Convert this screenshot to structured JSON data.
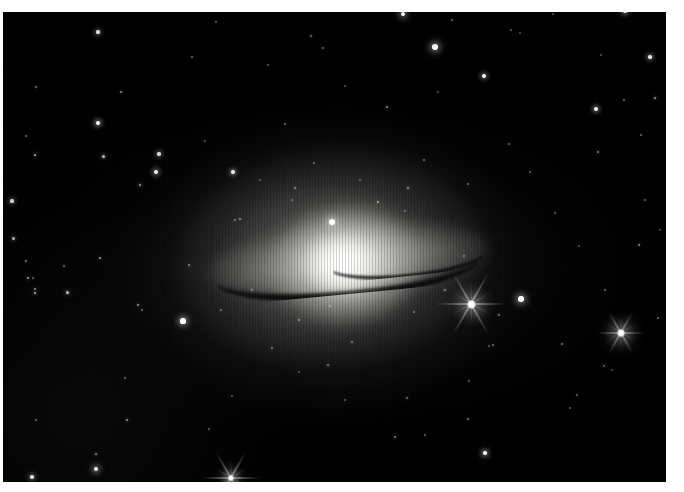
{
  "page": {
    "width": 684,
    "height": 492,
    "background_color": "#ffffff"
  },
  "plate": {
    "name": "sombrero-galaxy-photograph",
    "left": 3,
    "top": 12,
    "width": 663,
    "height": 470,
    "sky_color": "#000000",
    "border_color": "#ffffff"
  },
  "galaxy": {
    "label": "Sombrero Galaxy",
    "designation": "M104",
    "type": "edge-on spiral galaxy",
    "center_x": 335,
    "center_y": 262,
    "disk_position_angle_deg": -5.2,
    "disk_width": 280,
    "disk_height": 78,
    "bulge_width": 150,
    "bulge_height": 118,
    "core_color": "#ffffff",
    "halo_color": "#9a9892",
    "dust_lane_color": "#040405",
    "dust_lane_visible": true
  },
  "stars": [
    {
      "x": 98,
      "y": 32,
      "r": 1.6,
      "b": 0.85
    },
    {
      "x": 121,
      "y": 92,
      "r": 1.1,
      "b": 0.55
    },
    {
      "x": 98,
      "y": 123,
      "r": 2.1,
      "b": 1.0
    },
    {
      "x": 36,
      "y": 87,
      "r": 1.0,
      "b": 0.45
    },
    {
      "x": 26,
      "y": 136,
      "r": 1.0,
      "b": 0.4
    },
    {
      "x": 192,
      "y": 57,
      "r": 1.0,
      "b": 0.4
    },
    {
      "x": 216,
      "y": 22,
      "r": 0.9,
      "b": 0.35
    },
    {
      "x": 311,
      "y": 36,
      "r": 1.0,
      "b": 0.45
    },
    {
      "x": 268,
      "y": 65,
      "r": 0.9,
      "b": 0.35
    },
    {
      "x": 323,
      "y": 48,
      "r": 1.0,
      "b": 0.42
    },
    {
      "x": 403,
      "y": 14,
      "r": 2.4,
      "b": 1.0
    },
    {
      "x": 435,
      "y": 47,
      "r": 3.0,
      "b": 1.0
    },
    {
      "x": 452,
      "y": 20,
      "r": 0.9,
      "b": 0.38
    },
    {
      "x": 511,
      "y": 30,
      "r": 0.9,
      "b": 0.36
    },
    {
      "x": 520,
      "y": 33,
      "r": 0.8,
      "b": 0.3
    },
    {
      "x": 553,
      "y": 14,
      "r": 0.9,
      "b": 0.34
    },
    {
      "x": 601,
      "y": 55,
      "r": 0.9,
      "b": 0.33
    },
    {
      "x": 650,
      "y": 57,
      "r": 1.8,
      "b": 0.9
    },
    {
      "x": 484,
      "y": 76,
      "r": 1.9,
      "b": 0.95
    },
    {
      "x": 596,
      "y": 109,
      "r": 2.0,
      "b": 0.95
    },
    {
      "x": 625,
      "y": 11,
      "r": 2.2,
      "b": 1.0
    },
    {
      "x": 655,
      "y": 98,
      "r": 1.3,
      "b": 0.6
    },
    {
      "x": 624,
      "y": 100,
      "r": 1.0,
      "b": 0.42
    },
    {
      "x": 387,
      "y": 107,
      "r": 1.2,
      "b": 0.55
    },
    {
      "x": 438,
      "y": 92,
      "r": 0.9,
      "b": 0.34
    },
    {
      "x": 285,
      "y": 124,
      "r": 1.0,
      "b": 0.42
    },
    {
      "x": 345,
      "y": 86,
      "r": 0.9,
      "b": 0.32
    },
    {
      "x": 159,
      "y": 154,
      "r": 1.7,
      "b": 0.85
    },
    {
      "x": 35,
      "y": 155,
      "r": 1.4,
      "b": 0.68
    },
    {
      "x": 103,
      "y": 156,
      "r": 1.5,
      "b": 0.72
    },
    {
      "x": 156,
      "y": 172,
      "r": 2.0,
      "b": 0.95
    },
    {
      "x": 233,
      "y": 172,
      "r": 1.8,
      "b": 0.9
    },
    {
      "x": 140,
      "y": 185,
      "r": 1.4,
      "b": 0.65
    },
    {
      "x": 205,
      "y": 141,
      "r": 0.9,
      "b": 0.34
    },
    {
      "x": 12,
      "y": 201,
      "r": 1.6,
      "b": 0.8
    },
    {
      "x": 13,
      "y": 238,
      "r": 1.5,
      "b": 0.7
    },
    {
      "x": 26,
      "y": 261,
      "r": 1.1,
      "b": 0.48
    },
    {
      "x": 28,
      "y": 278,
      "r": 1.3,
      "b": 0.6
    },
    {
      "x": 33,
      "y": 278,
      "r": 1.0,
      "b": 0.4
    },
    {
      "x": 100,
      "y": 258,
      "r": 1.3,
      "b": 0.58
    },
    {
      "x": 64,
      "y": 266,
      "r": 1.1,
      "b": 0.46
    },
    {
      "x": 35,
      "y": 289,
      "r": 1.2,
      "b": 0.52
    },
    {
      "x": 67,
      "y": 292,
      "r": 1.5,
      "b": 0.75
    },
    {
      "x": 35,
      "y": 293,
      "r": 1.4,
      "b": 0.68
    },
    {
      "x": 138,
      "y": 305,
      "r": 1.3,
      "b": 0.58
    },
    {
      "x": 189,
      "y": 265,
      "r": 1.1,
      "b": 0.46
    },
    {
      "x": 142,
      "y": 310,
      "r": 1.0,
      "b": 0.4
    },
    {
      "x": 240,
      "y": 219,
      "r": 1.1,
      "b": 0.48
    },
    {
      "x": 235,
      "y": 220,
      "r": 1.0,
      "b": 0.4
    },
    {
      "x": 332,
      "y": 222,
      "r": 3.0,
      "b": 1.0
    },
    {
      "x": 295,
      "y": 188,
      "r": 1.1,
      "b": 0.5
    },
    {
      "x": 292,
      "y": 200,
      "r": 0.9,
      "b": 0.34
    },
    {
      "x": 378,
      "y": 202,
      "r": 1.2,
      "b": 0.55
    },
    {
      "x": 408,
      "y": 188,
      "r": 1.2,
      "b": 0.55
    },
    {
      "x": 405,
      "y": 211,
      "r": 0.9,
      "b": 0.36
    },
    {
      "x": 360,
      "y": 180,
      "r": 0.9,
      "b": 0.32
    },
    {
      "x": 314,
      "y": 163,
      "r": 0.9,
      "b": 0.34
    },
    {
      "x": 260,
      "y": 180,
      "r": 0.9,
      "b": 0.3
    },
    {
      "x": 424,
      "y": 160,
      "r": 1.0,
      "b": 0.4
    },
    {
      "x": 468,
      "y": 184,
      "r": 1.0,
      "b": 0.42
    },
    {
      "x": 330,
      "y": 306,
      "r": 1.0,
      "b": 0.4
    },
    {
      "x": 299,
      "y": 320,
      "r": 1.2,
      "b": 0.52
    },
    {
      "x": 272,
      "y": 348,
      "r": 1.0,
      "b": 0.42
    },
    {
      "x": 352,
      "y": 342,
      "r": 1.1,
      "b": 0.45
    },
    {
      "x": 328,
      "y": 365,
      "r": 1.1,
      "b": 0.45
    },
    {
      "x": 221,
      "y": 310,
      "r": 1.0,
      "b": 0.4
    },
    {
      "x": 252,
      "y": 290,
      "r": 1.0,
      "b": 0.38
    },
    {
      "x": 414,
      "y": 312,
      "r": 1.0,
      "b": 0.4
    },
    {
      "x": 445,
      "y": 290,
      "r": 1.2,
      "b": 0.52
    },
    {
      "x": 464,
      "y": 256,
      "r": 1.0,
      "b": 0.4
    },
    {
      "x": 521,
      "y": 299,
      "r": 2.8,
      "b": 1.0
    },
    {
      "x": 605,
      "y": 290,
      "r": 1.0,
      "b": 0.4
    },
    {
      "x": 499,
      "y": 315,
      "r": 1.1,
      "b": 0.45
    },
    {
      "x": 562,
      "y": 344,
      "r": 1.1,
      "b": 0.46
    },
    {
      "x": 493,
      "y": 345,
      "r": 1.0,
      "b": 0.4
    },
    {
      "x": 604,
      "y": 366,
      "r": 1.0,
      "b": 0.38
    },
    {
      "x": 183,
      "y": 321,
      "r": 2.6,
      "b": 1.0
    },
    {
      "x": 489,
      "y": 346,
      "r": 0.9,
      "b": 0.32
    },
    {
      "x": 469,
      "y": 381,
      "r": 1.0,
      "b": 0.4
    },
    {
      "x": 407,
      "y": 398,
      "r": 1.1,
      "b": 0.45
    },
    {
      "x": 345,
      "y": 400,
      "r": 0.9,
      "b": 0.34
    },
    {
      "x": 468,
      "y": 419,
      "r": 1.1,
      "b": 0.46
    },
    {
      "x": 425,
      "y": 435,
      "r": 1.0,
      "b": 0.4
    },
    {
      "x": 577,
      "y": 395,
      "r": 1.0,
      "b": 0.4
    },
    {
      "x": 395,
      "y": 437,
      "r": 1.2,
      "b": 0.52
    },
    {
      "x": 485,
      "y": 453,
      "r": 2.2,
      "b": 1.0
    },
    {
      "x": 570,
      "y": 408,
      "r": 0.9,
      "b": 0.34
    },
    {
      "x": 612,
      "y": 370,
      "r": 0.9,
      "b": 0.3
    },
    {
      "x": 96,
      "y": 454,
      "r": 1.2,
      "b": 0.52
    },
    {
      "x": 96,
      "y": 469,
      "r": 2.4,
      "b": 1.0
    },
    {
      "x": 32,
      "y": 477,
      "r": 1.8,
      "b": 0.85
    },
    {
      "x": 127,
      "y": 420,
      "r": 1.3,
      "b": 0.58
    },
    {
      "x": 125,
      "y": 378,
      "r": 1.0,
      "b": 0.4
    },
    {
      "x": 36,
      "y": 420,
      "r": 1.0,
      "b": 0.4
    },
    {
      "x": 209,
      "y": 429,
      "r": 0.9,
      "b": 0.34
    },
    {
      "x": 232,
      "y": 396,
      "r": 0.9,
      "b": 0.32
    },
    {
      "x": 299,
      "y": 372,
      "r": 0.9,
      "b": 0.32
    },
    {
      "x": 639,
      "y": 245,
      "r": 1.2,
      "b": 0.55
    },
    {
      "x": 660,
      "y": 230,
      "r": 0.9,
      "b": 0.32
    },
    {
      "x": 645,
      "y": 200,
      "r": 1.0,
      "b": 0.38
    },
    {
      "x": 598,
      "y": 152,
      "r": 1.2,
      "b": 0.52
    },
    {
      "x": 530,
      "y": 172,
      "r": 1.0,
      "b": 0.4
    },
    {
      "x": 555,
      "y": 213,
      "r": 1.0,
      "b": 0.38
    },
    {
      "x": 641,
      "y": 135,
      "r": 1.0,
      "b": 0.4
    },
    {
      "x": 509,
      "y": 144,
      "r": 1.0,
      "b": 0.38
    },
    {
      "x": 579,
      "y": 246,
      "r": 0.9,
      "b": 0.32
    },
    {
      "x": 658,
      "y": 318,
      "r": 1.0,
      "b": 0.4
    }
  ],
  "bright_stars": [
    {
      "name": "spike-star-right",
      "x": 471,
      "y": 304,
      "size": 9,
      "spread": 72,
      "brightness": 1.0
    },
    {
      "name": "spike-star-far-right",
      "x": 621,
      "y": 333,
      "size": 8,
      "spread": 48,
      "brightness": 0.95
    },
    {
      "name": "spike-star-bottom-edge",
      "x": 231,
      "y": 478,
      "size": 6,
      "spread": 58,
      "brightness": 1.0
    }
  ]
}
